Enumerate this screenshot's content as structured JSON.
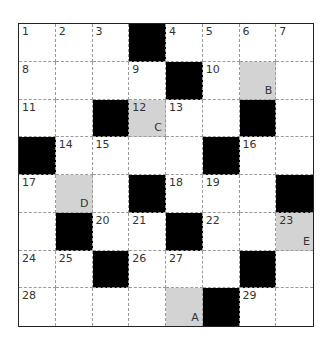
{
  "puzzle": {
    "rows": 8,
    "cols": 8,
    "colors": {
      "black": "#000000",
      "shaded": "#d3d3d3",
      "white": "#ffffff",
      "border": "#222222",
      "gridline": "#9a9a9a"
    },
    "cells": [
      [
        {
          "type": "white",
          "number": "1"
        },
        {
          "type": "white",
          "number": "2"
        },
        {
          "type": "white",
          "number": "3"
        },
        {
          "type": "black"
        },
        {
          "type": "white",
          "number": "4"
        },
        {
          "type": "white",
          "number": "5"
        },
        {
          "type": "white",
          "number": "6"
        },
        {
          "type": "white",
          "number": "7"
        }
      ],
      [
        {
          "type": "white",
          "number": "8"
        },
        {
          "type": "white"
        },
        {
          "type": "white"
        },
        {
          "type": "white",
          "number": "9"
        },
        {
          "type": "black"
        },
        {
          "type": "white",
          "number": "10"
        },
        {
          "type": "shaded",
          "letter": "B"
        },
        {
          "type": "white"
        }
      ],
      [
        {
          "type": "white",
          "number": "11"
        },
        {
          "type": "white"
        },
        {
          "type": "black"
        },
        {
          "type": "shaded",
          "number": "12",
          "letter": "C"
        },
        {
          "type": "white",
          "number": "13"
        },
        {
          "type": "white"
        },
        {
          "type": "black"
        },
        {
          "type": "white"
        }
      ],
      [
        {
          "type": "black"
        },
        {
          "type": "white",
          "number": "14"
        },
        {
          "type": "white",
          "number": "15"
        },
        {
          "type": "white"
        },
        {
          "type": "white"
        },
        {
          "type": "black"
        },
        {
          "type": "white",
          "number": "16"
        },
        {
          "type": "white"
        }
      ],
      [
        {
          "type": "white",
          "number": "17"
        },
        {
          "type": "shaded",
          "letter": "D"
        },
        {
          "type": "white"
        },
        {
          "type": "black"
        },
        {
          "type": "white",
          "number": "18"
        },
        {
          "type": "white",
          "number": "19"
        },
        {
          "type": "white"
        },
        {
          "type": "black"
        }
      ],
      [
        {
          "type": "white"
        },
        {
          "type": "black"
        },
        {
          "type": "white",
          "number": "20"
        },
        {
          "type": "white",
          "number": "21"
        },
        {
          "type": "black"
        },
        {
          "type": "white",
          "number": "22"
        },
        {
          "type": "white"
        },
        {
          "type": "shaded",
          "number": "23",
          "letter": "E"
        }
      ],
      [
        {
          "type": "white",
          "number": "24"
        },
        {
          "type": "white",
          "number": "25"
        },
        {
          "type": "black"
        },
        {
          "type": "white",
          "number": "26"
        },
        {
          "type": "white",
          "number": "27"
        },
        {
          "type": "white"
        },
        {
          "type": "black"
        },
        {
          "type": "white"
        }
      ],
      [
        {
          "type": "white",
          "number": "28"
        },
        {
          "type": "white"
        },
        {
          "type": "white"
        },
        {
          "type": "white"
        },
        {
          "type": "shaded",
          "letter": "A"
        },
        {
          "type": "black"
        },
        {
          "type": "white",
          "number": "29"
        },
        {
          "type": "white"
        }
      ]
    ]
  }
}
